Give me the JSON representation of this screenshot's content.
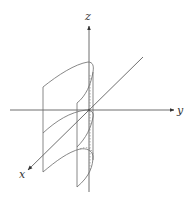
{
  "diagram": {
    "axes": {
      "x_label": "x",
      "y_label": "y",
      "z_label": "z"
    },
    "colors": {
      "axis": "#4a4a4a",
      "curve": "#6a6a6a",
      "hidden": "#8a8a8a",
      "background": "#ffffff"
    }
  }
}
